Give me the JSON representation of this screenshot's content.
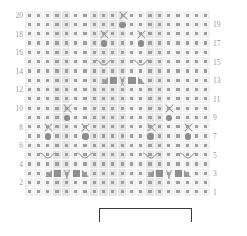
{
  "chart": {
    "type": "knitting-chart",
    "columns": 20,
    "rows": 20,
    "cell_size_px": 9.3,
    "colors": {
      "grid_background": "#f2f2f2",
      "grid_shade": "#e6e6e6",
      "grid_line": "#ffffff",
      "dot": "#9e9e9e",
      "symbol": "#8f8f8f",
      "label": "#9a9a9a",
      "bracket": "#3a3a3a"
    },
    "row_labels_left": [
      "20",
      "18",
      "16",
      "14",
      "12",
      "10",
      "8",
      "6",
      "4",
      "2"
    ],
    "row_labels_right": [
      "19",
      "17",
      "15",
      "13",
      "11",
      "9",
      "7",
      "5",
      "3",
      "1"
    ],
    "legend_note": "",
    "repeat_bracket": {
      "start_column": 9,
      "end_column": 18,
      "label": ""
    }
  },
  "chart_data": {
    "type": "heatmap",
    "xlabel": "",
    "ylabel": "Row",
    "grid": {
      "columns": 20,
      "rows": 20
    },
    "categories": [
      "1",
      "2",
      "3",
      "4",
      "5",
      "6",
      "7",
      "8",
      "9",
      "10",
      "11",
      "12",
      "13",
      "14",
      "15",
      "16",
      "17",
      "18",
      "19",
      "20"
    ],
    "row_labels_left": [
      "20",
      "18",
      "16",
      "14",
      "12",
      "10",
      "8",
      "6",
      "4",
      "2"
    ],
    "row_labels_right": [
      "19",
      "17",
      "15",
      "13",
      "11",
      "9",
      "7",
      "5",
      "3",
      "1"
    ],
    "symbol_key": {
      "dot": "knit stitch (background dot in every cell)",
      "x": "cross / twist stitch",
      "circle": "bobble",
      "square": "purl block",
      "v": "double decrease",
      "tri-right": "right-leaning decrease",
      "tri-left": "left-leaning decrease",
      "hook-right": "cable hook right",
      "hook-left": "cable hook left"
    },
    "shaded_columns": [
      4,
      5,
      8,
      9,
      10,
      11,
      14,
      15
    ],
    "symbols": [
      {
        "row": 20,
        "col": 11,
        "symbol": "x"
      },
      {
        "row": 19,
        "col": 11,
        "symbol": "circle"
      },
      {
        "row": 18,
        "col": 9,
        "symbol": "x"
      },
      {
        "row": 18,
        "col": 13,
        "symbol": "x"
      },
      {
        "row": 17,
        "col": 9,
        "symbol": "circle"
      },
      {
        "row": 17,
        "col": 13,
        "symbol": "circle"
      },
      {
        "row": 15,
        "col": 9,
        "symbol": "hook-right"
      },
      {
        "row": 15,
        "col": 13,
        "symbol": "hook-left"
      },
      {
        "row": 13,
        "col": 9,
        "symbol": "tri-right"
      },
      {
        "row": 13,
        "col": 10,
        "symbol": "square"
      },
      {
        "row": 13,
        "col": 11,
        "symbol": "v"
      },
      {
        "row": 13,
        "col": 12,
        "symbol": "square"
      },
      {
        "row": 13,
        "col": 13,
        "symbol": "tri-left"
      },
      {
        "row": 10,
        "col": 5,
        "symbol": "x"
      },
      {
        "row": 10,
        "col": 16,
        "symbol": "x"
      },
      {
        "row": 9,
        "col": 5,
        "symbol": "circle"
      },
      {
        "row": 9,
        "col": 16,
        "symbol": "circle"
      },
      {
        "row": 8,
        "col": 3,
        "symbol": "x"
      },
      {
        "row": 8,
        "col": 7,
        "symbol": "x"
      },
      {
        "row": 8,
        "col": 14,
        "symbol": "x"
      },
      {
        "row": 8,
        "col": 18,
        "symbol": "x"
      },
      {
        "row": 7,
        "col": 3,
        "symbol": "circle"
      },
      {
        "row": 7,
        "col": 7,
        "symbol": "circle"
      },
      {
        "row": 7,
        "col": 14,
        "symbol": "circle"
      },
      {
        "row": 7,
        "col": 18,
        "symbol": "circle"
      },
      {
        "row": 5,
        "col": 3,
        "symbol": "hook-right"
      },
      {
        "row": 5,
        "col": 7,
        "symbol": "hook-left"
      },
      {
        "row": 5,
        "col": 14,
        "symbol": "hook-right"
      },
      {
        "row": 5,
        "col": 18,
        "symbol": "hook-left"
      },
      {
        "row": 3,
        "col": 3,
        "symbol": "tri-right"
      },
      {
        "row": 3,
        "col": 4,
        "symbol": "square"
      },
      {
        "row": 3,
        "col": 5,
        "symbol": "v"
      },
      {
        "row": 3,
        "col": 6,
        "symbol": "square"
      },
      {
        "row": 3,
        "col": 7,
        "symbol": "tri-left"
      },
      {
        "row": 3,
        "col": 14,
        "symbol": "tri-right"
      },
      {
        "row": 3,
        "col": 15,
        "symbol": "square"
      },
      {
        "row": 3,
        "col": 16,
        "symbol": "v"
      },
      {
        "row": 3,
        "col": 17,
        "symbol": "square"
      },
      {
        "row": 3,
        "col": 18,
        "symbol": "tri-left"
      }
    ]
  }
}
